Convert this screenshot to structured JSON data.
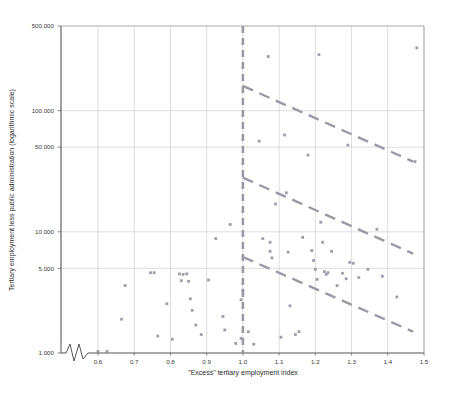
{
  "chart_data": {
    "type": "scatter",
    "title": "",
    "subtitle": "",
    "xlabel": "\"Excess\" tertiary employment index",
    "ylabel": "Tertiary employment less public administration (logarithmic scale)",
    "yscale": "log",
    "xscale": "linear",
    "xlim": [
      0.555,
      1.5
    ],
    "ylim": [
      1000,
      500000
    ],
    "xticks": [
      0.6,
      0.7,
      0.8,
      0.9,
      1.0,
      1.1,
      1.2,
      1.3,
      1.4,
      1.5
    ],
    "xtick_labels": [
      "0.6",
      "0.7",
      "0.8",
      "0.9",
      "1.0",
      "1.1",
      "1.2",
      "1.3",
      "1.4",
      "1.5"
    ],
    "yticks": [
      1000,
      5000,
      10000,
      50000,
      100000,
      500000
    ],
    "ytick_labels": [
      "1.000",
      "5.000",
      "10.000",
      "50.000",
      "100.000",
      "500.000"
    ],
    "grid": true,
    "grid_color": "#c8c8c8",
    "axis_color": "#555555",
    "point_color": "#8e8e9e",
    "line_color": "#9a9aa6",
    "axis_break": true,
    "legend": null,
    "legend_position": "none",
    "points": [
      {
        "x": 0.6,
        "y": 1030
      },
      {
        "x": 0.625,
        "y": 1030
      },
      {
        "x": 0.665,
        "y": 1900
      },
      {
        "x": 0.675,
        "y": 3600
      },
      {
        "x": 0.745,
        "y": 4600
      },
      {
        "x": 0.755,
        "y": 4600
      },
      {
        "x": 0.765,
        "y": 1380
      },
      {
        "x": 0.79,
        "y": 2550
      },
      {
        "x": 0.805,
        "y": 1300
      },
      {
        "x": 0.825,
        "y": 4500
      },
      {
        "x": 0.83,
        "y": 3950
      },
      {
        "x": 0.835,
        "y": 4450
      },
      {
        "x": 0.845,
        "y": 4500
      },
      {
        "x": 0.85,
        "y": 3900
      },
      {
        "x": 0.855,
        "y": 2800
      },
      {
        "x": 0.86,
        "y": 2250
      },
      {
        "x": 0.87,
        "y": 1700
      },
      {
        "x": 0.885,
        "y": 1420
      },
      {
        "x": 0.905,
        "y": 4000
      },
      {
        "x": 0.925,
        "y": 8800
      },
      {
        "x": 0.945,
        "y": 2000
      },
      {
        "x": 0.95,
        "y": 1550
      },
      {
        "x": 0.965,
        "y": 11500
      },
      {
        "x": 0.98,
        "y": 1200
      },
      {
        "x": 0.995,
        "y": 2750
      },
      {
        "x": 0.995,
        "y": 1320
      },
      {
        "x": 1.0,
        "y": 3300
      },
      {
        "x": 1.015,
        "y": 1500
      },
      {
        "x": 1.03,
        "y": 1180
      },
      {
        "x": 1.045,
        "y": 56000
      },
      {
        "x": 1.055,
        "y": 8800
      },
      {
        "x": 1.07,
        "y": 280000
      },
      {
        "x": 1.075,
        "y": 8200
      },
      {
        "x": 1.075,
        "y": 6900
      },
      {
        "x": 1.08,
        "y": 6100
      },
      {
        "x": 1.09,
        "y": 17000
      },
      {
        "x": 1.105,
        "y": 1350
      },
      {
        "x": 1.115,
        "y": 63000
      },
      {
        "x": 1.12,
        "y": 21000
      },
      {
        "x": 1.125,
        "y": 6800
      },
      {
        "x": 1.13,
        "y": 2450
      },
      {
        "x": 1.145,
        "y": 1420
      },
      {
        "x": 1.155,
        "y": 1500
      },
      {
        "x": 1.165,
        "y": 9000
      },
      {
        "x": 1.18,
        "y": 43000
      },
      {
        "x": 1.19,
        "y": 7000
      },
      {
        "x": 1.195,
        "y": 5800
      },
      {
        "x": 1.2,
        "y": 4900
      },
      {
        "x": 1.205,
        "y": 4050
      },
      {
        "x": 1.21,
        "y": 290000
      },
      {
        "x": 1.215,
        "y": 12000
      },
      {
        "x": 1.22,
        "y": 8200
      },
      {
        "x": 1.225,
        "y": 4700
      },
      {
        "x": 1.23,
        "y": 4450
      },
      {
        "x": 1.235,
        "y": 4600
      },
      {
        "x": 1.245,
        "y": 6900
      },
      {
        "x": 1.26,
        "y": 3600
      },
      {
        "x": 1.275,
        "y": 4550
      },
      {
        "x": 1.285,
        "y": 4100
      },
      {
        "x": 1.29,
        "y": 52000
      },
      {
        "x": 1.295,
        "y": 5600
      },
      {
        "x": 1.305,
        "y": 5500
      },
      {
        "x": 1.32,
        "y": 4200
      },
      {
        "x": 1.345,
        "y": 4900
      },
      {
        "x": 1.37,
        "y": 10500
      },
      {
        "x": 1.385,
        "y": 4300
      },
      {
        "x": 1.425,
        "y": 2900
      },
      {
        "x": 1.475,
        "y": 38000
      },
      {
        "x": 1.48,
        "y": 330000
      }
    ],
    "reference_lines": [
      {
        "name": "vertical-threshold",
        "orientation": "vertical",
        "x": 1.0,
        "style": "dashed"
      },
      {
        "name": "upper-envelope",
        "orientation": "sloped",
        "x0": 1.0,
        "y0": 160000,
        "x1": 1.47,
        "y1": 38000,
        "style": "dashed"
      },
      {
        "name": "middle-envelope",
        "orientation": "sloped",
        "x0": 1.0,
        "y0": 28000,
        "x1": 1.47,
        "y1": 6600,
        "style": "dashed"
      },
      {
        "name": "lower-envelope",
        "orientation": "sloped",
        "x0": 1.0,
        "y0": 6200,
        "x1": 1.47,
        "y1": 1500,
        "style": "dashed"
      }
    ]
  }
}
